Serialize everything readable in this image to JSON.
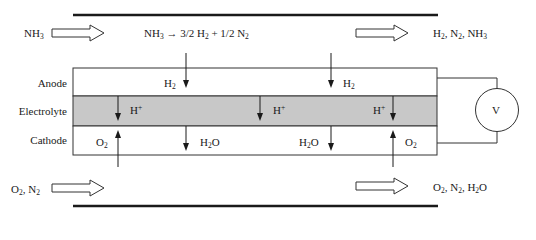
{
  "diagram": {
    "inlet_anode": {
      "parts": [
        "NH",
        "3",
        ""
      ]
    },
    "reaction": {
      "parts": [
        "NH",
        "3",
        " → 3/2 H",
        "2",
        " + 1/2 N",
        "2"
      ]
    },
    "outlet_anode": {
      "parts": [
        "H",
        "2",
        ", N",
        "2",
        ", NH",
        "3"
      ]
    },
    "inlet_cathode": {
      "parts": [
        "O",
        "2",
        ", N",
        "2"
      ]
    },
    "outlet_cathode": {
      "parts": [
        "O",
        "2",
        ", N",
        "2",
        ", H",
        "2",
        "O"
      ]
    },
    "layers": {
      "anode": "Anode",
      "electrolyte": "Electrolyte",
      "cathode": "Cathode"
    },
    "species": {
      "h2_left": [
        "H",
        "2"
      ],
      "h2_right": [
        "H",
        "2"
      ],
      "hplus_1": [
        "H",
        "+"
      ],
      "hplus_2": [
        "H",
        "+"
      ],
      "hplus_3": [
        "H",
        "+"
      ],
      "o2_left": [
        "O",
        "2"
      ],
      "o2_right": [
        "O",
        "2"
      ],
      "h2o_left": [
        "H",
        "2",
        "O"
      ],
      "h2o_right": [
        "H",
        "2",
        "O"
      ]
    },
    "voltmeter_label": "V",
    "colors": {
      "electrolyte_fill": "#c8c8c8",
      "line": "#1a1a1a",
      "background": "#ffffff"
    }
  }
}
